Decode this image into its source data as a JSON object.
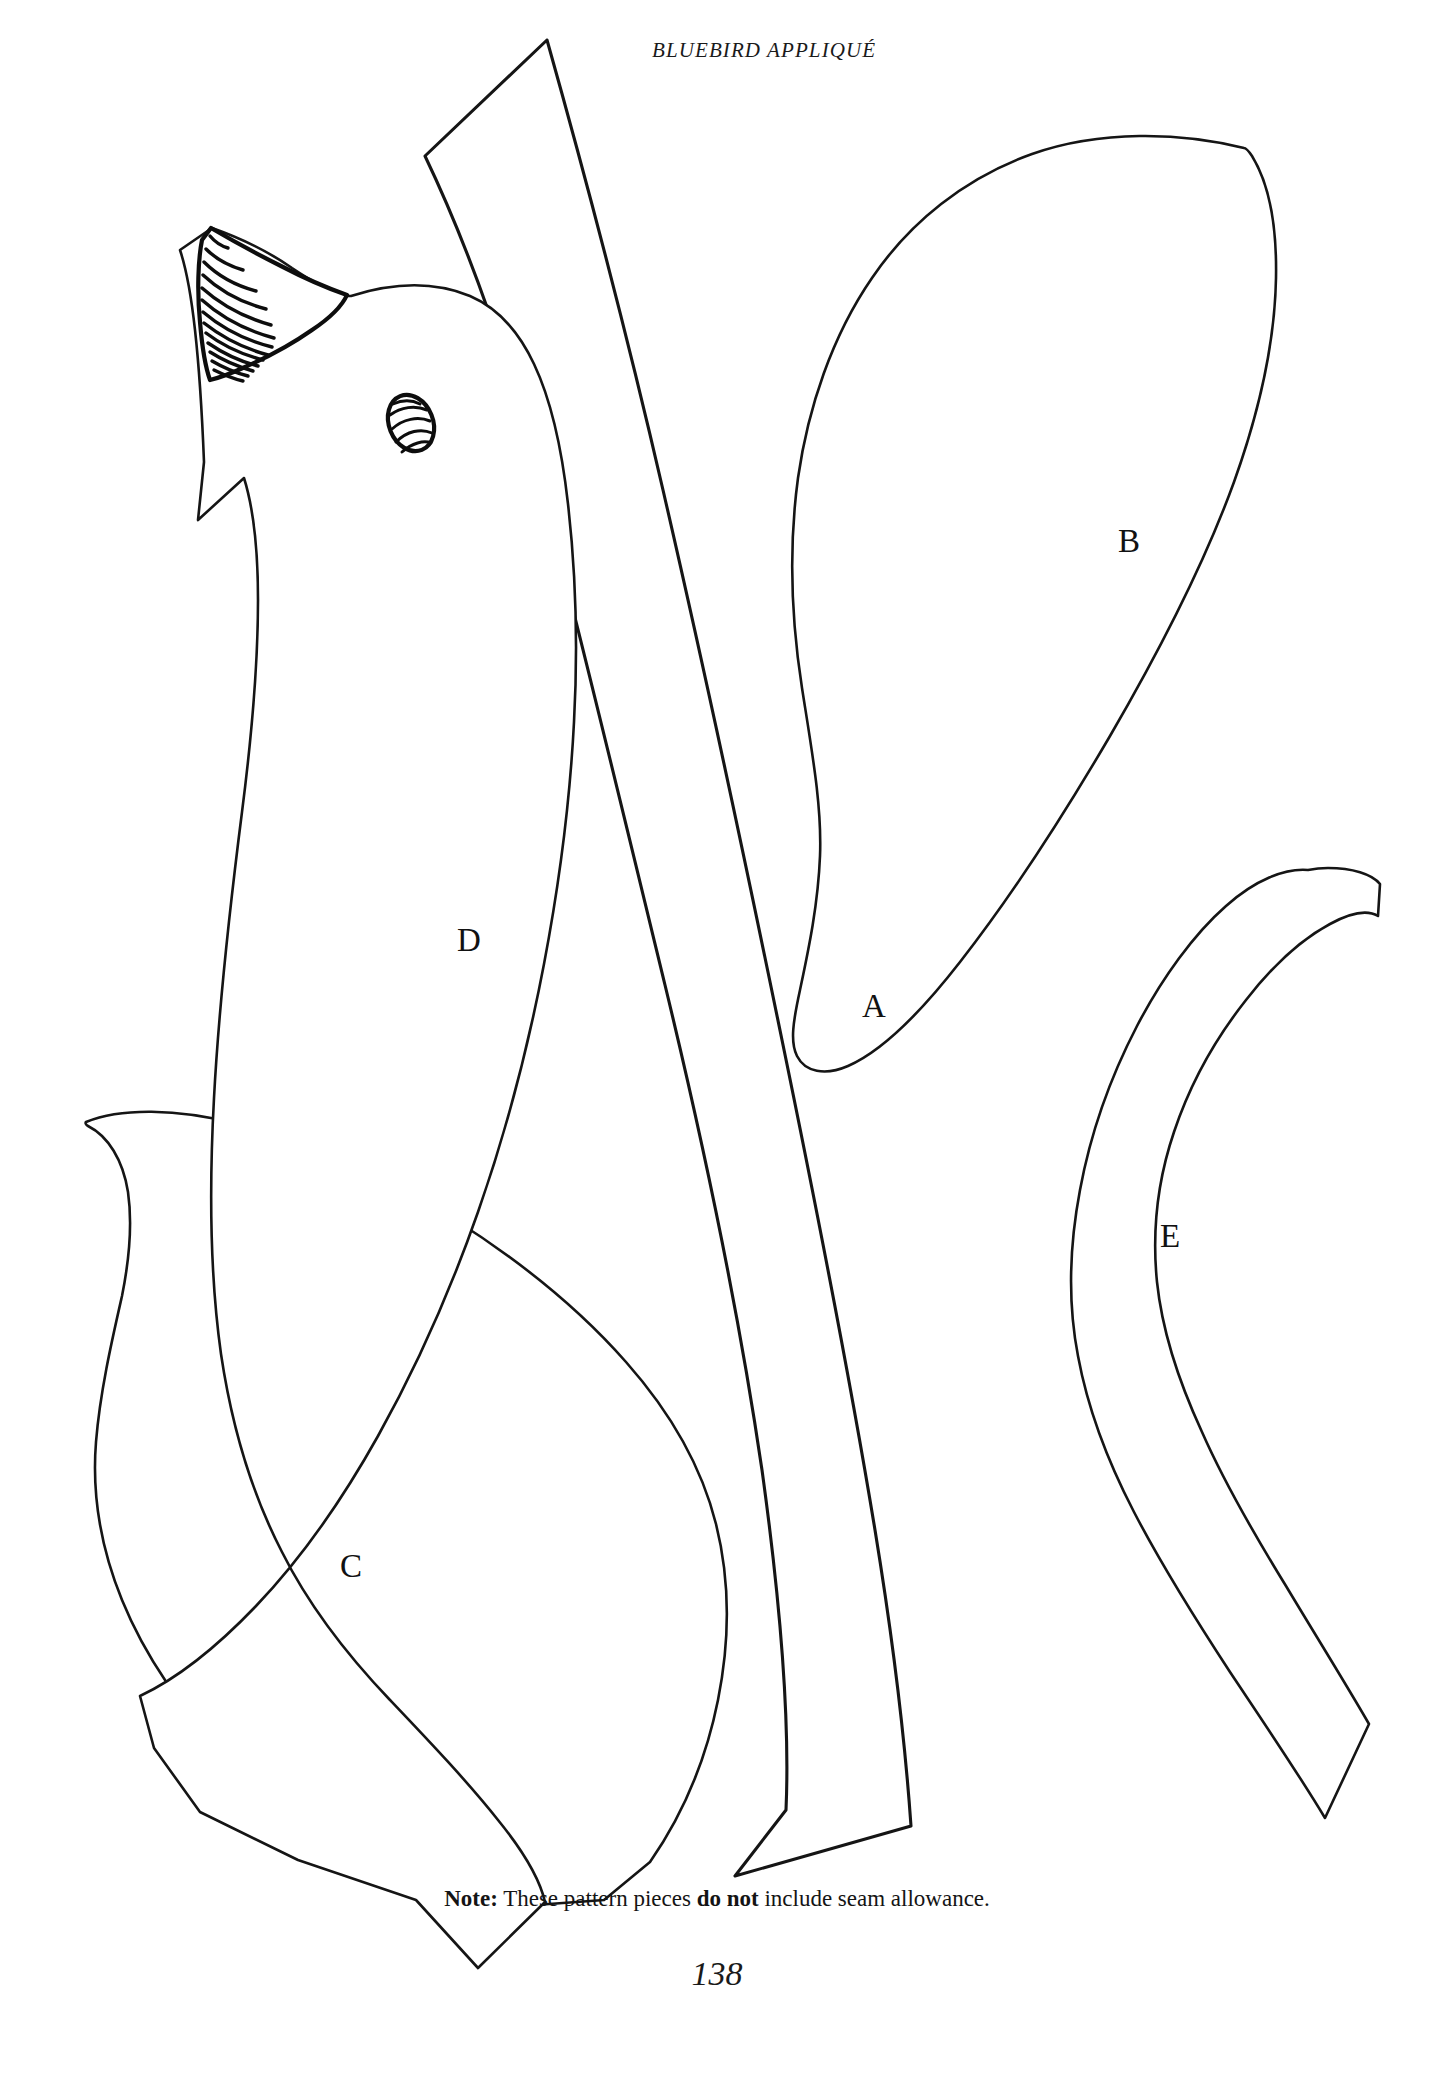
{
  "page": {
    "header_title": "BLUEBIRD APPLIQUÉ",
    "page_number": "138",
    "background_color": "#ffffff",
    "ink_color": "#151515",
    "width": 1434,
    "height": 2074
  },
  "note": {
    "prefix_bold": "Note:",
    "text_part_1": " These pattern pieces ",
    "emphasis_bold": "do not",
    "text_part_2": " include seam allowance."
  },
  "pieces": [
    {
      "id": "a",
      "label": "A",
      "name": "long-curved-wing-piece",
      "description": "long narrow curved strip running top-center to bottom-center"
    },
    {
      "id": "b",
      "label": "B",
      "name": "upper-leaf-piece",
      "description": "large teardrop leaf, upper right"
    },
    {
      "id": "c",
      "label": "C",
      "name": "lower-leaf-piece",
      "description": "large teardrop leaf, lower left"
    },
    {
      "id": "d",
      "label": "D",
      "name": "bird-body-piece",
      "description": "bluebird body with beak and eye, left side"
    },
    {
      "id": "e",
      "label": "E",
      "name": "curved-sickle-piece",
      "description": "slender S-curved sickle shape, right side"
    }
  ],
  "details": [
    {
      "name": "beak-hatching",
      "piece": "d",
      "stroke_count": 13
    },
    {
      "name": "eye-hatching",
      "piece": "d",
      "stroke_count": 5
    }
  ]
}
